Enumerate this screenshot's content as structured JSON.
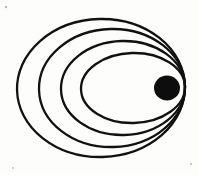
{
  "figure": {
    "title": "Nested elliptical orbits sharing a common focus",
    "kind": "line-diagram",
    "background_color": "#fdfdfc",
    "ink_color": "#111111",
    "canvas": {
      "width": 199,
      "height": 175
    },
    "style_note": "hand-drawn scanned ink line art"
  },
  "chart_data": {
    "type": "scatter",
    "title": "Nested elliptical orbits sharing a common focus",
    "subtitle": "",
    "xlabel": "",
    "ylabel": "",
    "xlim": [
      0,
      199
    ],
    "ylim": [
      0,
      175
    ],
    "grid": false,
    "legend": "none",
    "annotations": [],
    "focus_point": {
      "x": 167,
      "y": 88,
      "label": "common focus"
    },
    "central_body": {
      "name": "central-body",
      "shape": "filled-circle",
      "cx": 167,
      "cy": 88,
      "rx": 13,
      "ry": 12.5,
      "fill": "#0d0d0d"
    },
    "series": [
      {
        "name": "orbit-1-outermost",
        "cx": 101,
        "cy": 88,
        "rx": 84,
        "ry": 69,
        "rotation": -1.5,
        "stroke_width": 2.3,
        "left_vertex_x": 17,
        "right_vertex_x": 185,
        "top_vertex_y": 19,
        "bottom_vertex_y": 157
      },
      {
        "name": "orbit-2",
        "cx": 112,
        "cy": 88,
        "rx": 73,
        "ry": 59,
        "rotation": -1.5,
        "stroke_width": 2.3,
        "left_vertex_x": 39,
        "right_vertex_x": 185,
        "top_vertex_y": 29,
        "bottom_vertex_y": 147
      },
      {
        "name": "orbit-3",
        "cx": 123,
        "cy": 88,
        "rx": 62,
        "ry": 47,
        "rotation": -1.5,
        "stroke_width": 2.3,
        "left_vertex_x": 61,
        "right_vertex_x": 185,
        "top_vertex_y": 41,
        "bottom_vertex_y": 135
      },
      {
        "name": "orbit-4-innermost",
        "cx": 133,
        "cy": 88,
        "rx": 52,
        "ry": 35,
        "rotation": -1.5,
        "stroke_width": 2.3,
        "left_vertex_x": 81,
        "right_vertex_x": 185,
        "top_vertex_y": 53,
        "bottom_vertex_y": 123
      }
    ],
    "specks": [
      {
        "x": 6,
        "y": 7,
        "r": 1.2
      },
      {
        "x": 191,
        "y": 164,
        "r": 1.0
      },
      {
        "x": 13,
        "y": 168,
        "r": 0.9
      }
    ]
  }
}
